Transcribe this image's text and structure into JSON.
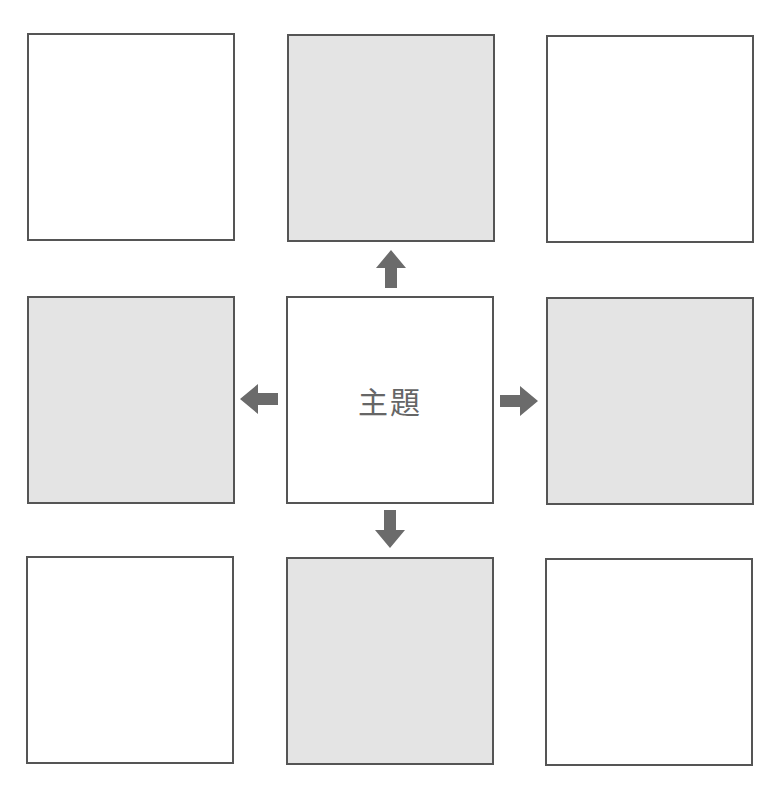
{
  "diagram": {
    "type": "3x3 mandala grid",
    "center_label": "主題",
    "colors": {
      "border": "#555555",
      "shaded": "#e4e4e4",
      "arrow": "#6b6b6b"
    },
    "cells": [
      {
        "pos": "top-left",
        "shaded": false,
        "text": ""
      },
      {
        "pos": "top-center",
        "shaded": true,
        "text": ""
      },
      {
        "pos": "top-right",
        "shaded": false,
        "text": ""
      },
      {
        "pos": "middle-left",
        "shaded": true,
        "text": ""
      },
      {
        "pos": "center",
        "shaded": false,
        "text": "主題"
      },
      {
        "pos": "middle-right",
        "shaded": true,
        "text": ""
      },
      {
        "pos": "bottom-left",
        "shaded": false,
        "text": ""
      },
      {
        "pos": "bottom-center",
        "shaded": true,
        "text": ""
      },
      {
        "pos": "bottom-right",
        "shaded": false,
        "text": ""
      }
    ],
    "arrows": [
      "up",
      "left",
      "right",
      "down"
    ]
  }
}
